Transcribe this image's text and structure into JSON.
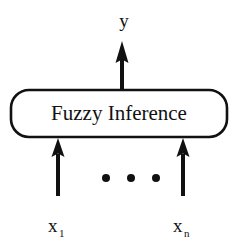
{
  "diagram": {
    "background_color": "#ffffff",
    "stroke_color": "#111111",
    "block": {
      "label": "Fuzzy Inference",
      "shape": "rounded-rectangle",
      "x": 11,
      "y": 90,
      "width": 216,
      "height": 47,
      "corner_radius": 18,
      "stroke_width": 2.6,
      "fill": "#ffffff"
    },
    "output": {
      "label": "y",
      "label_x": 124,
      "label_y": 26,
      "arrow": {
        "direction": "up",
        "x": 122,
        "tail_y": 90,
        "tip_y": 41,
        "shaft_width": 4,
        "head_width": 13,
        "head_height": 22
      }
    },
    "inputs": [
      {
        "label": "x",
        "subscript": "1",
        "label_x": 48,
        "label_y": 232,
        "arrow": {
          "direction": "up",
          "x": 58,
          "tail_y": 196,
          "tip_y": 138,
          "shaft_width": 4,
          "head_width": 13,
          "head_height": 19
        }
      },
      {
        "label": "x",
        "subscript": "n",
        "label_x": 173,
        "label_y": 232,
        "arrow": {
          "direction": "up",
          "x": 183,
          "tail_y": 196,
          "tip_y": 138,
          "shaft_width": 4,
          "head_width": 13,
          "head_height": 19
        }
      }
    ],
    "ellipsis_dots": {
      "count": 3,
      "radius": 4,
      "y": 178,
      "x_positions": [
        106,
        131,
        156
      ]
    }
  }
}
